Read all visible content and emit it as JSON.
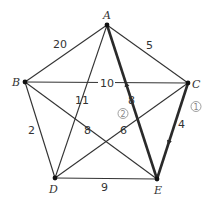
{
  "diagram": {
    "type": "weighted-graph",
    "vertices": [
      {
        "id": "A",
        "label": "A",
        "x": 107,
        "y": 25,
        "lx": 103,
        "ly": 19
      },
      {
        "id": "B",
        "label": "B",
        "x": 25,
        "y": 82,
        "lx": 12,
        "ly": 86
      },
      {
        "id": "C",
        "label": "C",
        "x": 188,
        "y": 83,
        "lx": 192,
        "ly": 88
      },
      {
        "id": "D",
        "label": "D",
        "x": 55,
        "y": 178,
        "lx": 49,
        "ly": 193
      },
      {
        "id": "E",
        "label": "E",
        "x": 157,
        "y": 179,
        "lx": 154,
        "ly": 194
      }
    ],
    "edges": [
      {
        "from": "A",
        "to": "B",
        "weight": "20",
        "lx": 53,
        "ly": 48,
        "bold": false
      },
      {
        "from": "A",
        "to": "C",
        "weight": "5",
        "lx": 146,
        "ly": 49,
        "bold": false
      },
      {
        "from": "B",
        "to": "C",
        "weight": "10",
        "lx": 100,
        "ly": 87,
        "bold": false
      },
      {
        "from": "A",
        "to": "D",
        "weight": "11",
        "lx": 75,
        "ly": 104,
        "bold": false
      },
      {
        "from": "A",
        "to": "E",
        "weight": "8",
        "lx": 128,
        "ly": 104,
        "bold": true,
        "arrow": "E-to-A",
        "order": "2"
      },
      {
        "from": "B",
        "to": "E",
        "weight": "8",
        "lx": 84,
        "ly": 134,
        "bold": false
      },
      {
        "from": "B",
        "to": "D",
        "weight": "2",
        "lx": 28,
        "ly": 134,
        "bold": false
      },
      {
        "from": "C",
        "to": "D",
        "weight": "6",
        "lx": 120,
        "ly": 134,
        "bold": false
      },
      {
        "from": "C",
        "to": "E",
        "weight": "4",
        "lx": 178,
        "ly": 128,
        "bold": true,
        "arrow": "C-to-E",
        "order": "1"
      },
      {
        "from": "D",
        "to": "E",
        "weight": "9",
        "lx": 101,
        "ly": 191,
        "bold": false
      }
    ],
    "order_markers": [
      {
        "label": "①",
        "x": 192,
        "y": 110
      },
      {
        "label": "②",
        "x": 119,
        "y": 117
      }
    ],
    "colors": {
      "edge": "#333333",
      "bold_edge": "#2a2a2a",
      "marker": "#888888"
    }
  }
}
